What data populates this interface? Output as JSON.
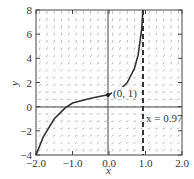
{
  "chart_data": {
    "type": "line",
    "title": "",
    "xlabel": "x",
    "ylabel": "y",
    "xlim": [
      -2.0,
      2.0
    ],
    "ylim": [
      -4,
      8
    ],
    "xticks": [
      "-2.0",
      "-1.0",
      "0.0",
      "1.0",
      "2.0"
    ],
    "yticks": [
      "-4",
      "-2",
      "0",
      "2",
      "4",
      "6",
      "8"
    ],
    "grid": false,
    "slope_field": true,
    "series": [
      {
        "name": "solution curve",
        "x": [
          -2.0,
          -1.8,
          -1.5,
          -1.2,
          -1.0,
          -0.5,
          0.0,
          0.3,
          0.5,
          0.7,
          0.8,
          0.9,
          0.93
        ],
        "y": [
          -4.0,
          -2.5,
          -1.0,
          -0.1,
          0.3,
          0.7,
          1.0,
          1.4,
          2.0,
          3.2,
          4.3,
          6.5,
          8.0
        ]
      }
    ],
    "annotations": [
      {
        "text": "(0, 1)",
        "x": 0,
        "y": 1,
        "type": "point"
      },
      {
        "text": "x = 0.97",
        "x": 0.97,
        "type": "vertical-asymptote-dashed"
      }
    ]
  },
  "labels": {
    "x_axis": "x",
    "y_axis": "y",
    "point": "(0, 1)",
    "asymptote": "x = 0.97",
    "xticks": [
      "−2.0",
      "−1.0",
      "0.0",
      "1.0",
      "2.0"
    ],
    "yticks": [
      "−4",
      "−2",
      "0",
      "2",
      "4",
      "6",
      "8"
    ]
  }
}
